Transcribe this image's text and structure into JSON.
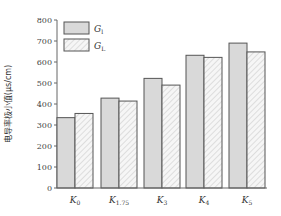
{
  "chart_data": {
    "type": "bar",
    "title": "",
    "xlabel": "",
    "ylabel": "电导率极小值(μs/cm)",
    "ylim": [
      0,
      800
    ],
    "yticks": [
      0,
      100,
      200,
      300,
      400,
      500,
      600,
      700,
      800
    ],
    "grid": false,
    "legend_position": "upper-left",
    "categories": [
      {
        "main": "K",
        "sub": "0"
      },
      {
        "main": "K",
        "sub": "1.75"
      },
      {
        "main": "K",
        "sub": "3"
      },
      {
        "main": "K",
        "sub": "4"
      },
      {
        "main": "K",
        "sub": "5"
      }
    ],
    "category_labels": [
      "K0",
      "K1.75",
      "K3",
      "K4",
      "K5"
    ],
    "series": [
      {
        "name": "Gl",
        "main": "G",
        "sub": "l",
        "pattern": "solid",
        "color": "#d9d9d9",
        "values": [
          335,
          428,
          522,
          632,
          690
        ]
      },
      {
        "name": "GL",
        "main": "G",
        "sub": "L",
        "pattern": "hatch",
        "color": "#f4f4f4",
        "values": [
          355,
          414,
          490,
          622,
          648
        ]
      }
    ],
    "colors": {
      "border": "#555555",
      "axis": "#666666",
      "hatch": "#b8b8b8"
    }
  }
}
